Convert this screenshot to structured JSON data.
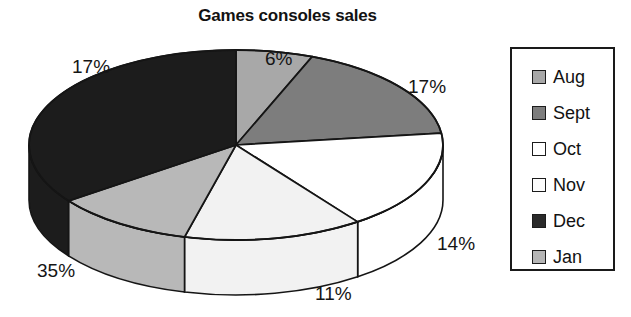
{
  "chart_data": {
    "type": "pie",
    "title": "Games consoles sales",
    "categories": [
      "Aug",
      "Sept",
      "Oct",
      "Nov",
      "Dec",
      "Jan"
    ],
    "values": [
      6,
      17,
      17,
      14,
      11,
      35
    ],
    "value_labels": [
      "6%",
      "17%",
      "17%",
      "14%",
      "11%",
      "35%"
    ],
    "unit": "%",
    "legend_position": "right",
    "grid": false,
    "three_d": true,
    "slice_colors": [
      "#a8a8a8",
      "#7d7d7d",
      "#ffffff",
      "#f0f0f0",
      "#1c1c1c",
      "#b5b5b5"
    ],
    "slices": [
      {
        "label": "Aug",
        "value": 6,
        "value_label": "6%",
        "color": "#a8a8a8"
      },
      {
        "label": "Sept",
        "value": 17,
        "value_label": "17%",
        "color": "#7d7d7d"
      },
      {
        "label": "Oct",
        "value": 17,
        "value_label": "17%",
        "color": "#ffffff"
      },
      {
        "label": "Nov",
        "value": 14,
        "value_label": "14%",
        "color": "#f0f0f0"
      },
      {
        "label": "Dec",
        "value": 11,
        "value_label": "11%",
        "color": "#b5b5b5"
      },
      {
        "label": "Jan",
        "value": 35,
        "value_label": "35%",
        "color": "#1c1c1c"
      }
    ]
  },
  "title": "Games consoles sales",
  "labels": {
    "top": "6%",
    "upper_right": "17%",
    "right": "14%",
    "bottom": "11%",
    "lower_left": "35%",
    "upper_left": "17%"
  },
  "legend": {
    "items": [
      {
        "label": "Aug",
        "color": "#a8a8a8"
      },
      {
        "label": "Sept",
        "color": "#7d7d7d"
      },
      {
        "label": "Oct",
        "color": "#ffffff"
      },
      {
        "label": "Nov",
        "color": "#fcfcfc"
      },
      {
        "label": "Dec",
        "color": "#2a2a2a"
      },
      {
        "label": "Jan",
        "color": "#b5b5b5"
      }
    ]
  },
  "colors": {
    "outline": "#1a1a1a",
    "text": "#121212",
    "background": "#ffffff"
  }
}
